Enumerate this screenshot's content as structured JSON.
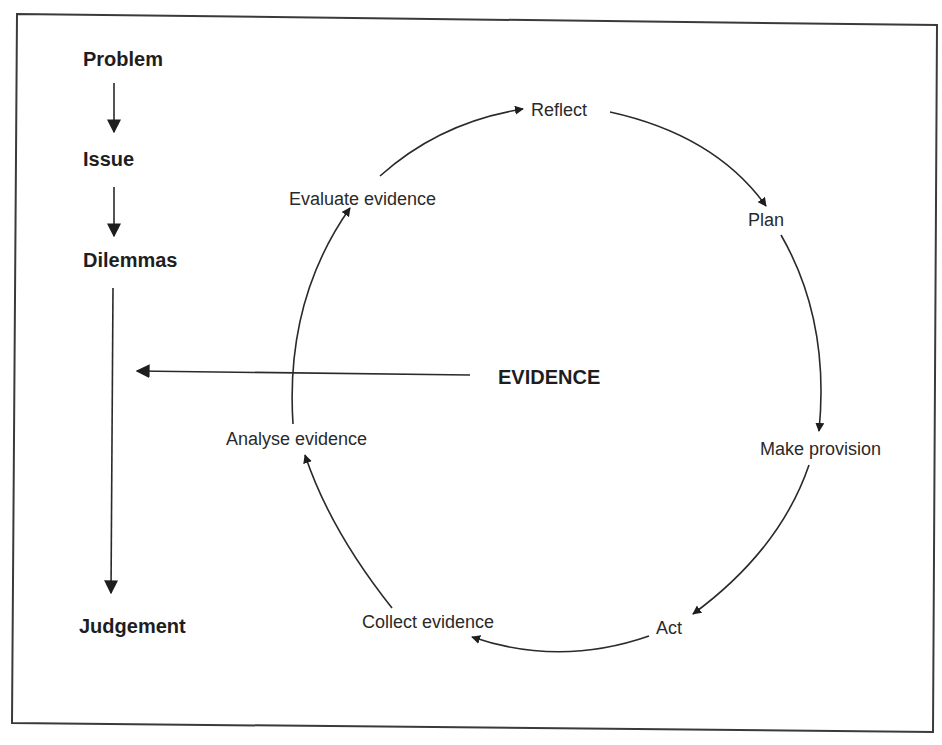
{
  "diagram": {
    "process_chain": {
      "steps": [
        "Problem",
        "Issue",
        "Dilemmas",
        "Judgement"
      ]
    },
    "evidence_label": "EVIDENCE",
    "cycle": {
      "direction": "clockwise",
      "steps": [
        "Reflect",
        "Plan",
        "Make provision",
        "Act",
        "Collect evidence",
        "Analyse evidence",
        "Evaluate evidence"
      ]
    },
    "colors": {
      "ink": "#1e1e1e",
      "background": "#ffffff"
    }
  }
}
